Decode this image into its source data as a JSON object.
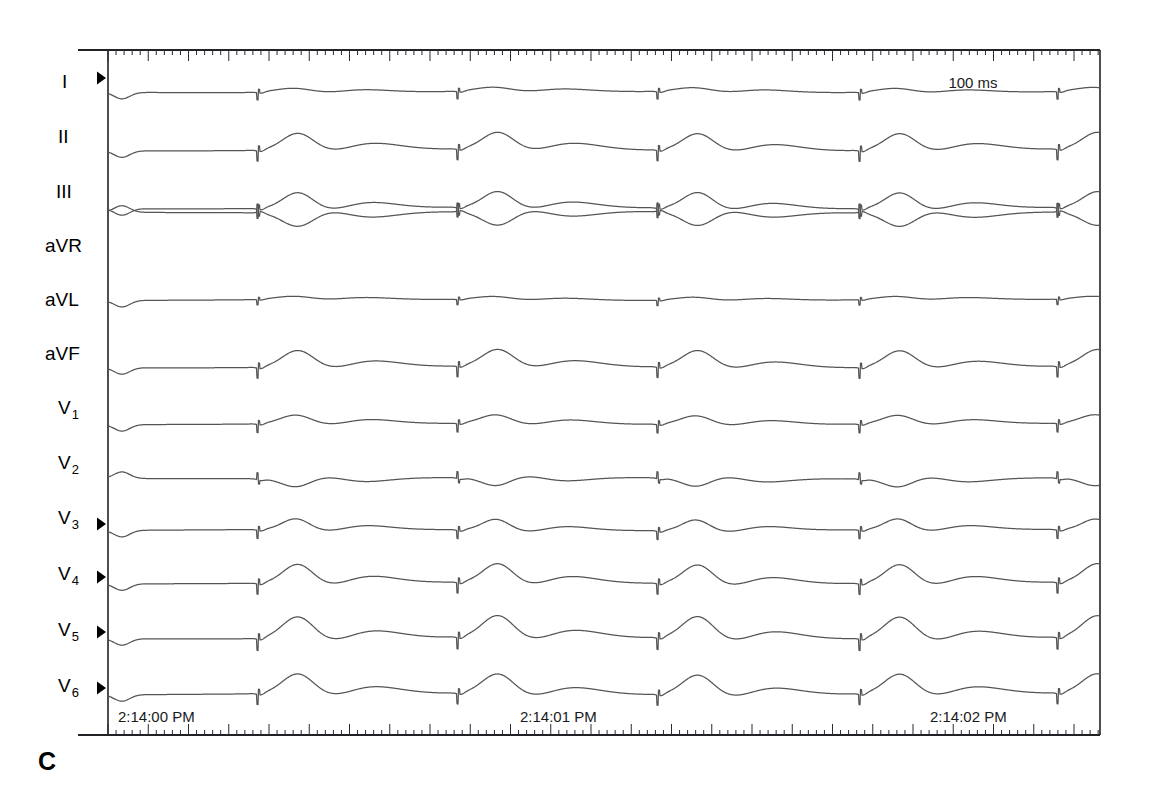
{
  "figure": {
    "panel_label": "C",
    "type": "12-lead electrocardiogram strip",
    "scale_annotation": "100 ms",
    "background_color": "#ffffff",
    "trace_color": "#555558",
    "axis_color": "#222226"
  },
  "axes": {
    "time_labels": [
      {
        "text": "2:14:00 PM",
        "x": 118
      },
      {
        "text": "2:14:01 PM",
        "x": 520
      },
      {
        "text": "2:14:02 PM",
        "x": 930
      }
    ],
    "ruler": {
      "minor_tick_spacing_px": 8.05,
      "major_tick_every": 5,
      "minor_tick_len": 5,
      "major_tick_len": 11,
      "minor_tick_label": "40 ms",
      "major_tick_label": "200 ms"
    },
    "plot_left": 108,
    "plot_right": 1100,
    "top_rule_y": 50,
    "bottom_rule_y": 735
  },
  "leads": [
    {
      "label": "I",
      "sub": "",
      "label_x": 62,
      "label_y": 88,
      "baseline": 92,
      "marker": true
    },
    {
      "label": "II",
      "sub": "",
      "label_x": 58,
      "label_y": 143,
      "baseline": 150,
      "marker": false
    },
    {
      "label": "III",
      "sub": "",
      "label_x": 56,
      "label_y": 198,
      "baseline": 208,
      "marker": false
    },
    {
      "label": "aVR",
      "sub": "",
      "label_x": 45,
      "label_y": 252,
      "baseline": 212,
      "marker": false
    },
    {
      "label": "aVL",
      "sub": "",
      "label_x": 45,
      "label_y": 306,
      "baseline": 300,
      "marker": false
    },
    {
      "label": "aVF",
      "sub": "",
      "label_x": 45,
      "label_y": 360,
      "baseline": 367,
      "marker": false
    },
    {
      "label": "V",
      "sub": "1",
      "label_x": 58,
      "label_y": 414,
      "baseline": 424,
      "marker": false
    },
    {
      "label": "V",
      "sub": "2",
      "label_x": 58,
      "label_y": 469,
      "baseline": 478,
      "marker": false
    },
    {
      "label": "V",
      "sub": "3",
      "label_x": 58,
      "label_y": 524,
      "baseline": 530,
      "marker": true
    },
    {
      "label": "V",
      "sub": "4",
      "label_x": 58,
      "label_y": 580,
      "baseline": 583,
      "marker": true
    },
    {
      "label": "V",
      "sub": "5",
      "label_x": 58,
      "label_y": 636,
      "baseline": 638,
      "marker": true
    },
    {
      "label": "V",
      "sub": "6",
      "label_x": 58,
      "label_y": 692,
      "baseline": 694,
      "marker": true
    }
  ],
  "chart_data": {
    "type": "line",
    "title": "",
    "xlabel": "Time",
    "ylabel": "Lead",
    "x_range_seconds": [
      0,
      2.47
    ],
    "sweep_mm_per_s": 25,
    "rhythm": "ventricular paced rhythm with pacing spikes preceding each wide QRS-T complex",
    "paced": true,
    "beats": [
      {
        "index": 1,
        "spike_x": 258,
        "qrs_peak_x": 302
      },
      {
        "index": 2,
        "spike_x": 458,
        "qrs_peak_x": 506
      },
      {
        "index": 3,
        "spike_x": 658,
        "qrs_peak_x": 706
      },
      {
        "index": 4,
        "spike_x": 860,
        "qrs_peak_x": 908
      },
      {
        "index": 5,
        "spike_x": 1058,
        "qrs_peak_x": 1100
      }
    ],
    "beat_interval_px": 200,
    "beat_interval_ms": 800,
    "heart_rate_bpm": 75,
    "series": [
      {
        "name": "I",
        "amplitude_rel": 0.3,
        "polarity": "positive",
        "drift": "rising baseline"
      },
      {
        "name": "II",
        "amplitude_rel": 0.8,
        "polarity": "positive",
        "drift": "rising baseline"
      },
      {
        "name": "III",
        "amplitude_rel": 0.75,
        "polarity": "positive",
        "drift": "rising baseline"
      },
      {
        "name": "aVR",
        "amplitude_rel": 0.7,
        "polarity": "negative",
        "drift": "falling baseline"
      },
      {
        "name": "aVL",
        "amplitude_rel": 0.22,
        "polarity": "positive",
        "drift": "flat"
      },
      {
        "name": "aVF",
        "amplitude_rel": 0.8,
        "polarity": "positive",
        "drift": "rising baseline"
      },
      {
        "name": "V1",
        "amplitude_rel": 0.45,
        "polarity": "positive",
        "drift": "flat"
      },
      {
        "name": "V2",
        "amplitude_rel": 0.4,
        "polarity": "negative",
        "drift": "flat"
      },
      {
        "name": "V3",
        "amplitude_rel": 0.5,
        "polarity": "positive",
        "drift": "flat"
      },
      {
        "name": "V4",
        "amplitude_rel": 0.85,
        "polarity": "positive",
        "drift": "flat"
      },
      {
        "name": "V5",
        "amplitude_rel": 1.0,
        "polarity": "positive",
        "drift": "flat"
      },
      {
        "name": "V6",
        "amplitude_rel": 0.9,
        "polarity": "positive",
        "drift": "flat"
      }
    ]
  }
}
